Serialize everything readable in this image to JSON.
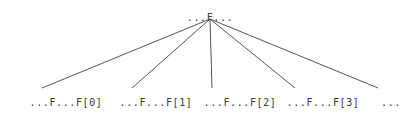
{
  "diagram": {
    "type": "tree",
    "background_color": "#ffffff",
    "edge_color": "#404040",
    "text_color": "#3a3a3a",
    "root": {
      "label": "...F...",
      "x": 210,
      "y": 12
    },
    "leaves": [
      {
        "label": "...F...F[0]",
        "x": 66,
        "y": 97,
        "edge_end_x": 42
      },
      {
        "label": "...F...F[1]",
        "x": 156,
        "y": 97,
        "edge_end_x": 132
      },
      {
        "label": "...F...F[2]",
        "x": 240,
        "y": 97,
        "edge_end_x": 212
      },
      {
        "label": "...F...F[3]",
        "x": 323,
        "y": 97,
        "edge_end_x": 295
      }
    ],
    "trailing": {
      "label": "...",
      "x": 391,
      "y": 97,
      "edge_end_x": 378
    },
    "apex": {
      "x": 210,
      "y": 19
    },
    "edge_baseline_y": 88
  }
}
